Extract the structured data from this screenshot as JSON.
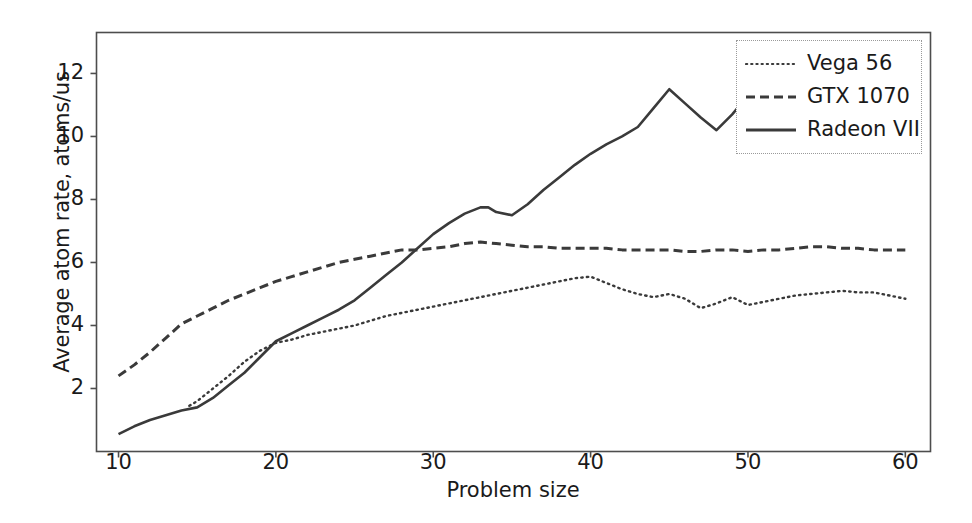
{
  "chart_data": {
    "type": "line",
    "title": "",
    "xlabel": "Problem size",
    "ylabel": "Average atom rate, atoms/us",
    "xlim": [
      8.6,
      61.6
    ],
    "ylim": [
      0.0,
      13.3
    ],
    "xticks": [
      10,
      20,
      30,
      40,
      50,
      60
    ],
    "yticks": [
      2,
      4,
      6,
      8,
      10,
      12
    ],
    "grid": false,
    "legend_position": "upper right",
    "series": [
      {
        "name": "Vega 56",
        "style": "dotted",
        "color": "#3a3a3a",
        "x": [
          14.5,
          15,
          16,
          17,
          18,
          19,
          20,
          21,
          22,
          23,
          24,
          25,
          26,
          27,
          28,
          29,
          30,
          31,
          32,
          33,
          34,
          35,
          36,
          37,
          38,
          39,
          40,
          41,
          42,
          43,
          44,
          45,
          46,
          47,
          48,
          49,
          50,
          51,
          52,
          53,
          54,
          55,
          56,
          57,
          58,
          59,
          60
        ],
        "y": [
          1.45,
          1.6,
          2.0,
          2.4,
          2.85,
          3.2,
          3.45,
          3.55,
          3.7,
          3.8,
          3.9,
          4.0,
          4.15,
          4.3,
          4.4,
          4.5,
          4.6,
          4.7,
          4.8,
          4.9,
          5.0,
          5.1,
          5.2,
          5.3,
          5.4,
          5.5,
          5.55,
          5.35,
          5.15,
          5.0,
          4.9,
          5.0,
          4.85,
          4.55,
          4.7,
          4.9,
          4.65,
          4.75,
          4.85,
          4.95,
          5.0,
          5.05,
          5.1,
          5.05,
          5.05,
          4.95,
          4.85
        ]
      },
      {
        "name": "GTX 1070",
        "style": "dashed",
        "color": "#3a3a3a",
        "x": [
          10,
          11,
          12,
          13,
          14,
          15,
          16,
          17,
          18,
          19,
          20,
          21,
          22,
          23,
          24,
          25,
          26,
          27,
          28,
          29,
          30,
          31,
          32,
          33,
          34,
          35,
          36,
          37,
          38,
          39,
          40,
          41,
          42,
          43,
          44,
          45,
          46,
          47,
          48,
          49,
          50,
          51,
          52,
          53,
          54,
          55,
          56,
          57,
          58,
          59,
          60
        ],
        "y": [
          2.4,
          2.75,
          3.15,
          3.6,
          4.05,
          4.3,
          4.55,
          4.8,
          5.0,
          5.2,
          5.4,
          5.55,
          5.7,
          5.85,
          6.0,
          6.1,
          6.2,
          6.3,
          6.4,
          6.4,
          6.45,
          6.5,
          6.6,
          6.65,
          6.6,
          6.55,
          6.5,
          6.5,
          6.45,
          6.45,
          6.45,
          6.45,
          6.4,
          6.4,
          6.4,
          6.4,
          6.35,
          6.35,
          6.4,
          6.4,
          6.35,
          6.4,
          6.4,
          6.45,
          6.5,
          6.5,
          6.45,
          6.45,
          6.4,
          6.4,
          6.4
        ]
      },
      {
        "name": "Radeon VII",
        "style": "solid",
        "color": "#3a3a3a",
        "x": [
          10,
          11,
          12,
          13,
          14,
          15,
          16,
          17,
          18,
          19,
          20,
          21,
          22,
          23,
          24,
          25,
          26,
          27,
          28,
          29,
          30,
          31,
          32,
          33,
          33.5,
          34,
          35,
          36,
          37,
          38,
          39,
          40,
          41,
          42,
          43,
          44,
          45,
          46,
          47,
          48,
          49,
          50,
          51
        ],
        "y": [
          0.55,
          0.8,
          1.0,
          1.15,
          1.3,
          1.4,
          1.7,
          2.1,
          2.5,
          3.0,
          3.5,
          3.75,
          4.0,
          4.25,
          4.5,
          4.8,
          5.2,
          5.6,
          6.0,
          6.45,
          6.9,
          7.25,
          7.55,
          7.75,
          7.75,
          7.6,
          7.5,
          7.85,
          8.3,
          8.7,
          9.1,
          9.45,
          9.75,
          10.0,
          10.3,
          10.9,
          11.5,
          11.05,
          10.6,
          10.2,
          10.7,
          11.3,
          11.85
        ]
      }
    ]
  },
  "axes": {
    "xticklabels": [
      "10",
      "20",
      "30",
      "40",
      "50",
      "60"
    ],
    "yticklabels": [
      "2",
      "4",
      "6",
      "8",
      "10",
      "12"
    ],
    "xlabel": "Problem size",
    "ylabel": "Average atom rate, atoms/us"
  },
  "legend": {
    "entries": [
      {
        "label": "Vega 56",
        "style": "dotted"
      },
      {
        "label": "GTX 1070",
        "style": "dashed"
      },
      {
        "label": "Radeon VII",
        "style": "solid"
      }
    ]
  },
  "colors": {
    "line": "#3a3a3a",
    "spine": "#4d4d4d",
    "background": "#ffffff"
  }
}
